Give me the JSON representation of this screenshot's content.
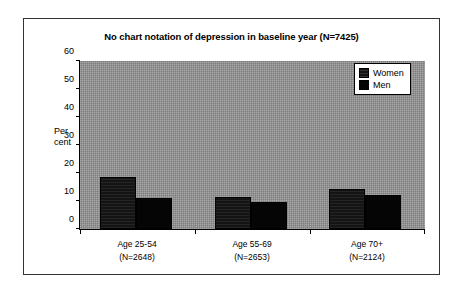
{
  "figure": {
    "background_color": "#ffffff",
    "frame_color": "#333333",
    "plot_background_color": "#8e8e8e"
  },
  "chart_data": {
    "type": "bar",
    "title": "No chart notation of depression in baseline year (N=7425)",
    "xlabel": "",
    "ylabel": "Per cent",
    "ylabel_line1": "Per",
    "ylabel_line2": "cent",
    "ylim": [
      0,
      60
    ],
    "yticks": [
      0,
      10,
      20,
      30,
      40,
      50,
      60
    ],
    "ytick_labels": [
      "0",
      "10",
      "20",
      "30",
      "40",
      "50",
      "60"
    ],
    "grid": false,
    "legend_position": "top-right",
    "categories": [
      "Age 25-54",
      "Age 55-69",
      "Age 70+"
    ],
    "category_counts": [
      "(N=2648)",
      "(N=2653)",
      "(N=2124)"
    ],
    "category_labels": [
      {
        "line1": "Age 25-54",
        "line2": "(N=2648)"
      },
      {
        "line1": "Age 55-69",
        "line2": "(N=2653)"
      },
      {
        "line1": "Age 70+",
        "line2": "(N=2124)"
      }
    ],
    "series": [
      {
        "name": "Women",
        "color": "#151515",
        "values": [
          18.6,
          11.4,
          14.4
        ]
      },
      {
        "name": "Men",
        "color": "#040404",
        "values": [
          11.1,
          9.7,
          12.1
        ]
      }
    ]
  },
  "legend": {
    "entries": [
      {
        "label": "Women",
        "color": "#151515"
      },
      {
        "label": "Men",
        "color": "#040404"
      }
    ]
  }
}
